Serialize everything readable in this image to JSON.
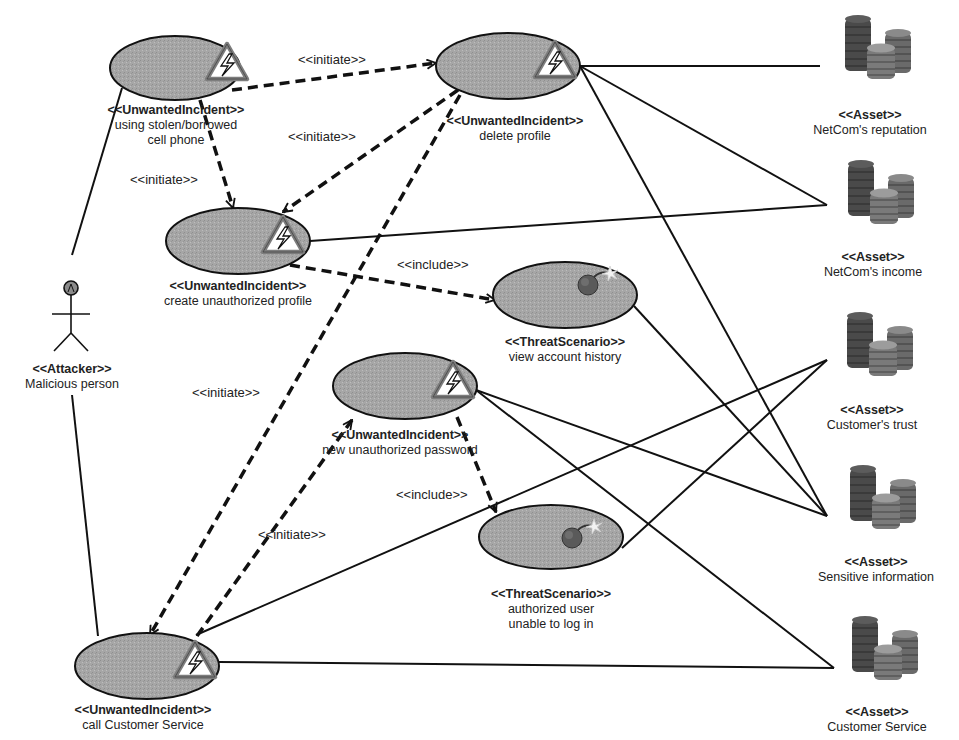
{
  "diagram": {
    "type": "CORAS threat diagram",
    "colors": {
      "node_fill": "#a9a9a9",
      "line": "#111111",
      "warning_border": "#7a7a7a",
      "background": "#ffffff"
    },
    "attacker": {
      "stereotype": "<<Attacker>>",
      "name": "Malicious person",
      "icon": "stick-figure-icon"
    },
    "incidents": [
      {
        "id": "u1",
        "stereotype": "<<UnwantedIncident>>",
        "name_lines": [
          "using stolen/borrowed",
          "cell phone"
        ],
        "icon": "warning-lightning-icon"
      },
      {
        "id": "u2",
        "stereotype": "<<UnwantedIncident>>",
        "name_lines": [
          "delete profile"
        ],
        "icon": "warning-lightning-icon"
      },
      {
        "id": "u3",
        "stereotype": "<<UnwantedIncident>>",
        "name_lines": [
          "create unauthorized profile"
        ],
        "icon": "warning-lightning-icon"
      },
      {
        "id": "u4",
        "stereotype": "<<UnwantedIncident>>",
        "name_lines": [
          "new unauthorized password"
        ],
        "icon": "warning-lightning-icon"
      },
      {
        "id": "u5",
        "stereotype": "<<UnwantedIncident>>",
        "name_lines": [
          "call Customer Service"
        ],
        "icon": "warning-lightning-icon"
      }
    ],
    "threat_scenarios": [
      {
        "id": "t1",
        "stereotype": "<<ThreatScenario>>",
        "name_lines": [
          "view account history"
        ],
        "icon": "bomb-icon"
      },
      {
        "id": "t2",
        "stereotype": "<<ThreatScenario>>",
        "name_lines": [
          "authorized user",
          "unable to log in"
        ],
        "icon": "bomb-icon"
      }
    ],
    "assets": [
      {
        "id": "a1",
        "stereotype": "<<Asset>>",
        "name": "NetCom's reputation",
        "icon": "coin-stack-icon"
      },
      {
        "id": "a2",
        "stereotype": "<<Asset>>",
        "name": "NetCom's income",
        "icon": "coin-stack-icon"
      },
      {
        "id": "a3",
        "stereotype": "<<Asset>>",
        "name": "Customer's trust",
        "icon": "coin-stack-icon"
      },
      {
        "id": "a4",
        "stereotype": "<<Asset>>",
        "name": "Sensitive information",
        "icon": "coin-stack-icon"
      },
      {
        "id": "a5",
        "stereotype": "<<Asset>>",
        "name": "Customer Service",
        "icon": "coin-stack-icon"
      }
    ],
    "relation_labels": {
      "initiate_u1_u2": "<<initiate>>",
      "initiate_u2_u3": "<<initiate>>",
      "initiate_u1_u3": "<<initiate>>",
      "include_u3_t1": "<<include>>",
      "initiate_u2_u5": "<<initiate>>",
      "include_u4_t2": "<<include>>",
      "initiate_u5_u4": "<<initiate>>"
    },
    "relations": [
      {
        "from": "u1",
        "to": "u2",
        "kind": "initiate",
        "style": "dashed-arrow"
      },
      {
        "from": "u2",
        "to": "u3",
        "kind": "initiate",
        "style": "dashed-arrow"
      },
      {
        "from": "u1",
        "to": "u3",
        "kind": "initiate",
        "style": "dashed-arrow"
      },
      {
        "from": "u3",
        "to": "t1",
        "kind": "include",
        "style": "dashed-arrow"
      },
      {
        "from": "u2",
        "to": "u5",
        "kind": "initiate",
        "style": "dashed-arrow"
      },
      {
        "from": "u5",
        "to": "u4",
        "kind": "initiate",
        "style": "dashed-arrow"
      },
      {
        "from": "u4",
        "to": "t2",
        "kind": "include",
        "style": "dashed-arrow"
      },
      {
        "from": "attacker",
        "to": "u1",
        "style": "solid"
      },
      {
        "from": "attacker",
        "to": "u5",
        "style": "solid"
      },
      {
        "from": "u2",
        "to": "a1",
        "style": "solid"
      },
      {
        "from": "u2",
        "to": "a2",
        "style": "solid"
      },
      {
        "from": "u2",
        "to": "a4",
        "style": "solid"
      },
      {
        "from": "u3",
        "to": "a2",
        "style": "solid"
      },
      {
        "from": "t1",
        "to": "a4",
        "style": "solid"
      },
      {
        "from": "u4",
        "to": "a4",
        "style": "solid"
      },
      {
        "from": "u4",
        "to": "a5",
        "style": "solid"
      },
      {
        "from": "t2",
        "to": "a3",
        "style": "solid"
      },
      {
        "from": "u5",
        "to": "a3",
        "style": "solid"
      },
      {
        "from": "u5",
        "to": "a5",
        "style": "solid"
      }
    ]
  }
}
